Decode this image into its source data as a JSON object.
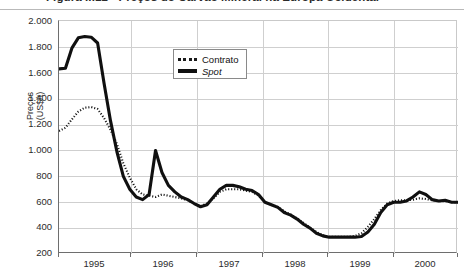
{
  "figure": {
    "title": "Figura II.12 - Preços do Carvão Mineral na Europa Ocidental",
    "title_note": "top of title cropped by screenshot edge"
  },
  "legend": {
    "position": "inside-top-left",
    "entries": [
      {
        "label": "Contrato",
        "style": "dotted",
        "italic": false
      },
      {
        "label": "Spot",
        "style": "solid-bold",
        "italic": true
      }
    ]
  },
  "axes": {
    "y": {
      "label_line1": "Preços",
      "label_line2": "(US$/t)",
      "ticks": [
        "2.000",
        "1.800",
        "1.600",
        "1.400",
        "1.200",
        "1.000",
        "800",
        "600",
        "400",
        "200"
      ],
      "min": 200,
      "max": 2000,
      "step": 200
    },
    "x": {
      "ticks": [
        "1995",
        "1996",
        "1997",
        "1998",
        "1999",
        "2000"
      ],
      "min": 1994.75,
      "max": 2000.95
    }
  },
  "chart_data": {
    "type": "line",
    "title": "Figura II.12 - Preços do Carvão Mineral na Europa Ocidental",
    "xlabel": "",
    "ylabel": "Preços (US$/t)",
    "ylim": [
      200,
      2000
    ],
    "xlim": [
      1994.75,
      2000.95
    ],
    "grid": true,
    "legend_position": "upper-left-inside",
    "x": [
      1994.75,
      1994.85,
      1994.95,
      1995.05,
      1995.15,
      1995.25,
      1995.35,
      1995.45,
      1995.55,
      1995.65,
      1995.75,
      1995.85,
      1995.95,
      1996.05,
      1996.15,
      1996.25,
      1996.35,
      1996.45,
      1996.55,
      1996.65,
      1996.75,
      1996.85,
      1996.95,
      1997.05,
      1997.15,
      1997.25,
      1997.35,
      1997.45,
      1997.55,
      1997.65,
      1997.75,
      1997.85,
      1997.95,
      1998.05,
      1998.15,
      1998.25,
      1998.35,
      1998.45,
      1998.55,
      1998.65,
      1998.75,
      1998.85,
      1998.95,
      1999.05,
      1999.15,
      1999.25,
      1999.35,
      1999.45,
      1999.55,
      1999.65,
      1999.75,
      1999.85,
      1999.95,
      2000.05,
      2000.15,
      2000.25,
      2000.35,
      2000.45,
      2000.55,
      2000.65,
      2000.75,
      2000.85,
      2000.95
    ],
    "series": [
      {
        "name": "Spot",
        "style": "solid-bold",
        "values": [
          1630,
          1635,
          1790,
          1870,
          1880,
          1875,
          1830,
          1520,
          1230,
          990,
          800,
          700,
          640,
          620,
          660,
          1000,
          830,
          730,
          680,
          640,
          620,
          590,
          565,
          580,
          640,
          700,
          730,
          730,
          720,
          700,
          690,
          660,
          600,
          580,
          560,
          520,
          500,
          470,
          430,
          400,
          360,
          340,
          330,
          330,
          330,
          330,
          330,
          335,
          370,
          430,
          520,
          580,
          600,
          600,
          610,
          640,
          680,
          660,
          620,
          610,
          615,
          600,
          600
        ]
      },
      {
        "name": "Contrato",
        "style": "dotted",
        "values": [
          1150,
          1175,
          1240,
          1300,
          1330,
          1335,
          1320,
          1250,
          1160,
          1050,
          900,
          790,
          700,
          660,
          650,
          640,
          660,
          650,
          640,
          630,
          615,
          590,
          570,
          590,
          630,
          680,
          700,
          700,
          700,
          690,
          680,
          650,
          600,
          580,
          565,
          530,
          505,
          475,
          440,
          405,
          370,
          345,
          332,
          332,
          332,
          333,
          340,
          360,
          410,
          470,
          540,
          590,
          610,
          615,
          615,
          620,
          630,
          625,
          615,
          608,
          608,
          600,
          598
        ]
      }
    ]
  }
}
